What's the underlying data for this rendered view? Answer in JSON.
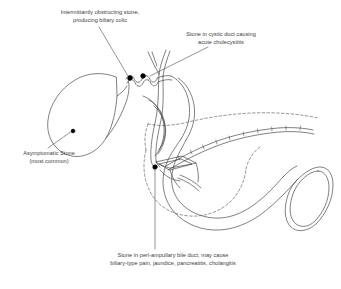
{
  "figure": {
    "background_color": "#ffffff",
    "ink_color": "#3d3d3d",
    "stone_color": "#000000",
    "width": 341,
    "height": 289
  },
  "labels": {
    "intermittent": {
      "line1": "Intermittantly obstructing stone,",
      "line2": "producing biliary colic"
    },
    "cystic_duct": {
      "line1": "Stone in cystic duct causing",
      "line2": "acute cholecystitis"
    },
    "asymptomatic": {
      "line1": "Asymptomatic Stone",
      "line2": "(most common)"
    },
    "periampullary": {
      "line1": "Stone in peri-ampullary bile duct, may cause",
      "line2": "biliary-type pain, jaundice, pancreatitis, cholangitis"
    }
  },
  "anatomy": {
    "gallbladder": "gallbladder-outline",
    "cystic_duct": "cystic-duct-spiral",
    "common_bile_duct": "common-bile-duct",
    "hepatic_ducts": "hepatic-duct-confluence",
    "duodenum": "duodenum-c-loop",
    "pancreas": "pancreas-dashed-outline",
    "pancreatic_duct": "pancreatic-duct-with-branches",
    "ampulla": "ampulla-of-vater"
  },
  "stones": [
    {
      "name": "stone-asymptomatic-gallbladder",
      "cx": 73,
      "cy": 131
    },
    {
      "name": "stone-cystic-duct-neck",
      "cx": 130,
      "cy": 78
    },
    {
      "name": "stone-cystic-duct-distal",
      "cx": 143,
      "cy": 76
    },
    {
      "name": "stone-peri-ampullary",
      "cx": 155,
      "cy": 167
    }
  ]
}
